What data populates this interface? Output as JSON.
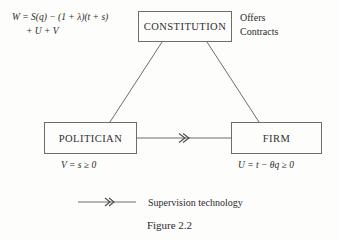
{
  "figure": {
    "caption": "Figure 2.2",
    "background_color": "#fdfdfc",
    "line_color": "#6d6d6d",
    "text_color": "#2b2b2b"
  },
  "nodes": {
    "constitution": {
      "label": "CONSTITUTION"
    },
    "politician": {
      "label": "POLITICIAN"
    },
    "firm": {
      "label": "FIRM"
    }
  },
  "annotations": {
    "welfare_formula_line1": "W = S(q) − (1 + λ)(t + s)",
    "welfare_formula_line2": "+ U + V",
    "offers_contracts_line1": "Offers",
    "offers_contracts_line2": "Contracts",
    "politician_payoff": "V = s ≥ 0",
    "firm_payoff": "U = t − θq ≥ 0"
  },
  "legend": {
    "symbol_name": "double-chevron-arrow",
    "label": "Supervision technology"
  }
}
